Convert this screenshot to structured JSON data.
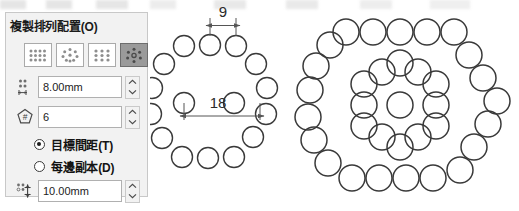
{
  "panel": {
    "title": "複製排列配置(O)",
    "pattern_types": [
      {
        "name": "linear-array",
        "label": "線性排列",
        "selected": false
      },
      {
        "name": "circular-array",
        "label": "環形排列",
        "selected": false
      },
      {
        "name": "rectangular-array",
        "label": "矩形排列",
        "selected": false
      },
      {
        "name": "polygon-array",
        "label": "多邊形排列",
        "selected": true
      }
    ],
    "spacing_field": {
      "icon": "spacing-icon",
      "value": "8.00mm",
      "placeholder": "8.00mm"
    },
    "count_field": {
      "icon": "polygon-count-icon",
      "value": "6",
      "placeholder": "6"
    },
    "radios": [
      {
        "label": "目標間距(T)",
        "checked": true,
        "name": "target-spacing"
      },
      {
        "label": "每邊副本(D)",
        "checked": false,
        "name": "copies-per-side"
      }
    ],
    "distance_field": {
      "icon": "row-spacing-icon",
      "value": "10.00mm",
      "placeholder": "10.00mm"
    },
    "colors": {
      "panel_bg": "#f2f2f2",
      "panel_border": "#c8c8c8",
      "field_bg": "#ffffff",
      "selected_btn_bg": "#9a9a9a",
      "text": "#141414"
    }
  },
  "drawings": {
    "middle": {
      "name": "hexagon-ring-preview",
      "dimensions": [
        {
          "name": "side-spacing",
          "value": "9"
        },
        {
          "name": "across-spacing",
          "value": "18"
        }
      ],
      "ring_count": 2,
      "polygon_sides": 6,
      "circles_per_side": 3
    },
    "right": {
      "name": "hexagon-nested-array",
      "ring_count": 3,
      "polygon_sides": 6,
      "has_center_circle": true
    }
  },
  "style": {
    "circle_stroke": "#3a3a3a",
    "dim_line": "#555555"
  }
}
